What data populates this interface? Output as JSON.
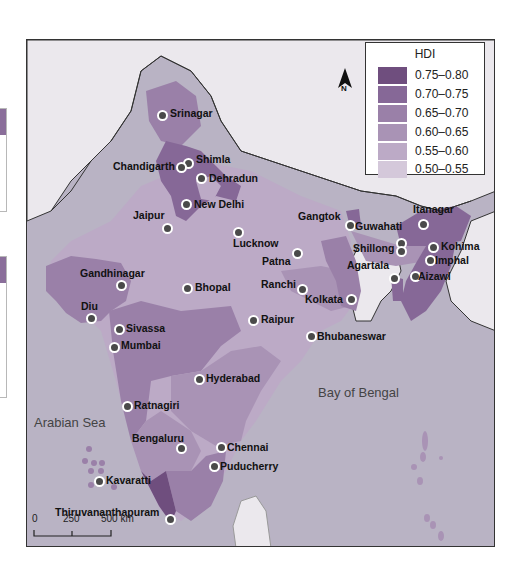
{
  "map": {
    "title": "HDI",
    "legend": {
      "title": "HDI",
      "items": [
        {
          "label": "0.75–0.80",
          "color": "#6f4e7e"
        },
        {
          "label": "0.70–0.75",
          "color": "#866897"
        },
        {
          "label": "0.65–0.70",
          "color": "#9a80a8"
        },
        {
          "label": "0.60–0.65",
          "color": "#a993b5"
        },
        {
          "label": "0.55–0.60",
          "color": "#bcaac6"
        },
        {
          "label": "0.50–0.55",
          "color": "#d4c8da"
        }
      ]
    },
    "colors": {
      "sea": "#b9b3c4",
      "foreign_land": "#ebe8ed",
      "border": "#333333"
    },
    "north_label": "N",
    "seas": [
      {
        "name": "Arabian Sea"
      },
      {
        "name": "Bay of Bengal"
      }
    ],
    "scale": {
      "ticks": [
        "0",
        "250",
        "500 km"
      ]
    },
    "cities": [
      {
        "name": "Srinagar"
      },
      {
        "name": "Shimla"
      },
      {
        "name": "Chandigarth"
      },
      {
        "name": "Dehradun"
      },
      {
        "name": "New Delhi"
      },
      {
        "name": "Jaipur"
      },
      {
        "name": "Lucknow"
      },
      {
        "name": "Gangtok"
      },
      {
        "name": "Guwahati"
      },
      {
        "name": "Itanagar"
      },
      {
        "name": "Shillong"
      },
      {
        "name": "Kohima"
      },
      {
        "name": "Imphal"
      },
      {
        "name": "Agartala"
      },
      {
        "name": "Aizawl"
      },
      {
        "name": "Patna"
      },
      {
        "name": "Ranchi"
      },
      {
        "name": "Kolkata"
      },
      {
        "name": "Gandhinagar"
      },
      {
        "name": "Bhopal"
      },
      {
        "name": "Diu"
      },
      {
        "name": "Raipur"
      },
      {
        "name": "Bhubaneswar"
      },
      {
        "name": "Sivassa"
      },
      {
        "name": "Mumbai"
      },
      {
        "name": "Hyderabad"
      },
      {
        "name": "Ratnagiri"
      },
      {
        "name": "Bengaluru"
      },
      {
        "name": "Chennai"
      },
      {
        "name": "Puducherry"
      },
      {
        "name": "Kavaratti"
      },
      {
        "name": "Thiruvananthapuram"
      }
    ]
  }
}
